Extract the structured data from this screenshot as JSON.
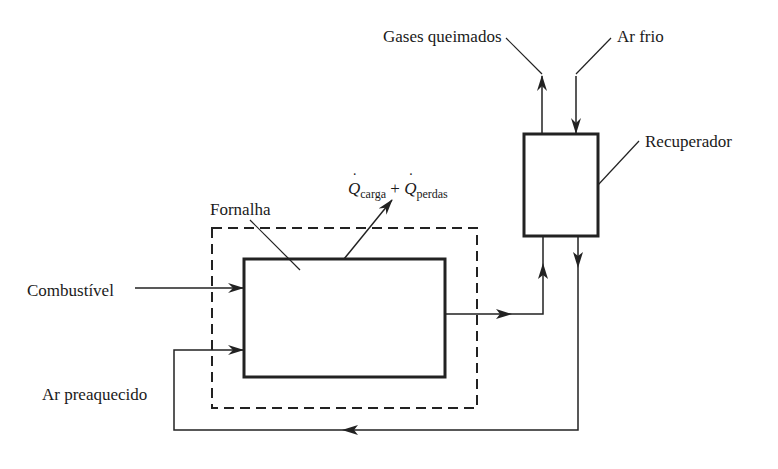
{
  "diagram": {
    "type": "process flow diagram",
    "labels": {
      "gases": "Gases queimados",
      "ar_frio": "Ar frio",
      "recuperador": "Recuperador",
      "q_carga_symbol": "Q",
      "q_carga_sub": "carga",
      "plus": "+",
      "q_perdas_symbol": "Q",
      "q_perdas_sub": "perdas",
      "fornalha": "Fornalha",
      "combustivel": "Combustível",
      "ar_preaquecido": "Ar preaquecido",
      "dot": "˙"
    },
    "caption_partial": "",
    "colors": {
      "line": "#222222",
      "background": "#ffffff"
    },
    "nodes": [
      {
        "id": "fornalha",
        "label": "Fornalha",
        "shape": "rectangle"
      },
      {
        "id": "control-volume",
        "label": "",
        "shape": "dashed-rectangle"
      },
      {
        "id": "recuperador",
        "label": "Recuperador",
        "shape": "rectangle"
      }
    ],
    "edges": [
      {
        "from": "Combustível",
        "to": "fornalha"
      },
      {
        "from": "Ar preaquecido",
        "to": "fornalha"
      },
      {
        "from": "fornalha",
        "to": "recuperador",
        "label": "gases"
      },
      {
        "from": "recuperador",
        "to": "Gases queimados"
      },
      {
        "from": "Ar frio",
        "to": "recuperador"
      },
      {
        "from": "recuperador",
        "to": "fornalha",
        "label": "Ar preaquecido (loop)"
      },
      {
        "from": "fornalha",
        "to": "Qcarga + Qperdas"
      }
    ]
  }
}
